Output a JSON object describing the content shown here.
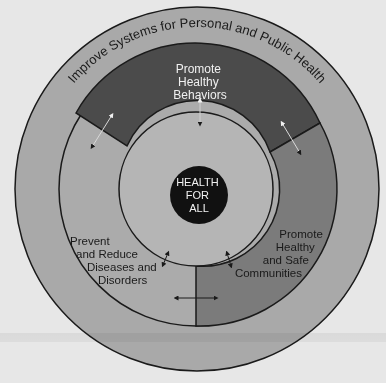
{
  "diagram": {
    "outer_ring": {
      "label": "Improve Systems for Personal and Public Health"
    },
    "segments": {
      "top": {
        "lines": [
          "Promote",
          "Healthy",
          "Behaviors"
        ]
      },
      "right": {
        "lines": [
          "Promote",
          "Healthy",
          "and Safe",
          "Communities"
        ]
      },
      "left": {
        "lines": [
          "Prevent",
          "and Reduce",
          "Diseases and",
          "Disorders"
        ]
      }
    },
    "center": {
      "lines": [
        "HEALTH",
        "FOR",
        "ALL"
      ]
    }
  },
  "colors": {
    "background": "#e7e7e7",
    "outer_ring": "#a9a9a9",
    "segment_top": "#4b4b4b",
    "segment_right": "#7b7b7b",
    "segment_left": "#ababab",
    "inner_circle": "#b5b5b5",
    "center_disc": "#111111",
    "outline": "#1a1a1a"
  }
}
